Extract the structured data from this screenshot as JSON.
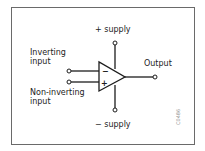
{
  "diagram": {
    "labels": {
      "plus_supply": "+ supply",
      "minus_supply": "− supply",
      "inverting_line1": "Inverting",
      "inverting_line2": "input",
      "noninverting_line1": "Non-inverting",
      "noninverting_line2": "input",
      "output": "Output"
    },
    "symbols": {
      "inverting_sign": "−",
      "noninverting_sign": "+"
    },
    "figure_code": "C0486",
    "colors": {
      "line": "#1c1c1c",
      "frame": "#6a6a6a",
      "background": "#ffffff"
    }
  }
}
